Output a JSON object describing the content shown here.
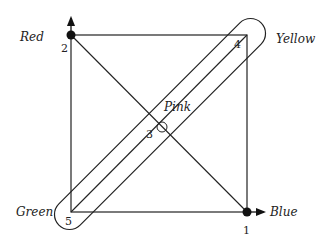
{
  "diagram": {
    "type": "graph-in-square",
    "vertices": [
      {
        "id": "1",
        "label": "Blue",
        "number": "1",
        "x": 247,
        "y": 212,
        "filled": true
      },
      {
        "id": "2",
        "label": "Red",
        "number": "2",
        "x": 71,
        "y": 35,
        "filled": true
      },
      {
        "id": "3",
        "label": "Pink",
        "number": "3",
        "x": 159,
        "y": 127,
        "filled": false
      },
      {
        "id": "4",
        "label": "Yellow",
        "number": "4",
        "x": 247,
        "y": 35,
        "filled": false
      },
      {
        "id": "5",
        "label": "Green",
        "number": "5",
        "x": 71,
        "y": 212,
        "filled": false
      }
    ],
    "labels": {
      "red": "Red",
      "yellow": "Yellow",
      "pink": "Pink",
      "green": "Green",
      "blue": "Blue"
    },
    "numbers": {
      "n1": "1",
      "n2": "2",
      "n3": "3",
      "n4": "4",
      "n5": "5"
    }
  }
}
